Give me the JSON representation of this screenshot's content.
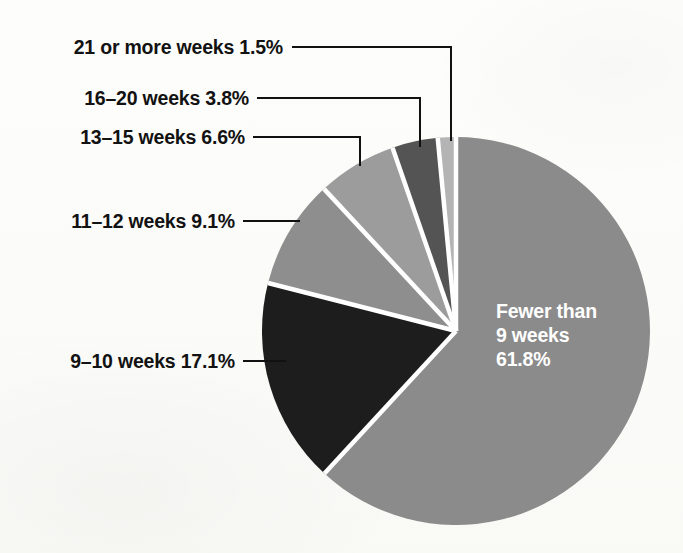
{
  "chart_data": {
    "type": "pie",
    "title": "",
    "subtitle": "",
    "xlabel": "",
    "ylabel": "",
    "legend_position": "none",
    "grid": false,
    "units": "percent",
    "start_angle_deg": 0,
    "direction": "clockwise",
    "categories": [
      "Fewer than 9 weeks",
      "9-10 weeks",
      "11-12 weeks",
      "13-15 weeks",
      "16-20 weeks",
      "21 or more weeks"
    ],
    "values": [
      61.8,
      17.1,
      9.1,
      6.6,
      3.8,
      1.5
    ],
    "slices": [
      {
        "name": "Fewer than 9 weeks",
        "label_text": "Fewer than\n9 weeks\n61.8%",
        "label_line_1": "Fewer than",
        "label_line_2": "9 weeks",
        "label_line_3": "61.8%",
        "value": 61.8,
        "value_text": "61.8%",
        "color": "#8b8b8b",
        "label_placement": "inside",
        "label_color": "#ffffff"
      },
      {
        "name": "9-10 weeks",
        "label_text": "9–10 weeks 17.1%",
        "value": 17.1,
        "value_text": "17.1%",
        "color": "#1d1d1d",
        "label_placement": "outside-left",
        "label_color": "#121212"
      },
      {
        "name": "11-12 weeks",
        "label_text": "11–12 weeks 9.1%",
        "value": 9.1,
        "value_text": "9.1%",
        "color": "#8e8e8e",
        "label_placement": "outside-left",
        "label_color": "#121212"
      },
      {
        "name": "13-15 weeks",
        "label_text": "13–15 weeks 6.6%",
        "value": 6.6,
        "value_text": "6.6%",
        "color": "#9c9c9c",
        "label_placement": "outside-left",
        "label_color": "#121212"
      },
      {
        "name": "16-20 weeks",
        "label_text": "16–20 weeks 3.8%",
        "value": 3.8,
        "value_text": "3.8%",
        "color": "#545454",
        "label_placement": "outside-left",
        "label_color": "#121212"
      },
      {
        "name": "21 or more weeks",
        "label_text": "21 or more weeks 1.5%",
        "value": 1.5,
        "value_text": "1.5%",
        "color": "#b4b4b4",
        "label_placement": "outside-left",
        "label_color": "#121212"
      }
    ],
    "separator_color": "#ffffff",
    "leader_line_color": "#111111",
    "background_color": "#fcfcfa"
  },
  "geometry": {
    "center_x": 456,
    "center_y": 331,
    "radius": 194
  }
}
